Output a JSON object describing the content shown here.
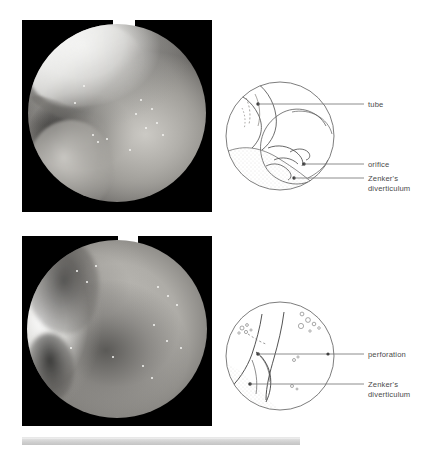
{
  "figure": {
    "background_color": "#ffffff",
    "width": 434,
    "height": 449
  },
  "panels": [
    {
      "id": "panel-top",
      "photo": {
        "name": "endoscopic-photo-zenker-with-tube",
        "alt_text": "Endoscopic photograph showing Zenker's diverticulum with nasogastric tube",
        "background_color": "#000000",
        "frame": {
          "x": 22,
          "y": 20,
          "width": 190,
          "height": 192
        }
      },
      "diagram": {
        "name": "line-diagram-zenker-with-tube",
        "frame": {
          "x": 228,
          "y": 80,
          "width": 108,
          "height": 118
        },
        "labels": [
          {
            "key": "tube",
            "text": "tube",
            "lines": [
              "tube"
            ]
          },
          {
            "key": "orifice",
            "text": "orifice",
            "lines": [
              "orifice"
            ]
          },
          {
            "key": "diverticulum",
            "text": "Zenker's diverticulum",
            "lines": [
              "Zenker's",
              "diverticulum"
            ]
          }
        ]
      }
    },
    {
      "id": "panel-bottom",
      "photo": {
        "name": "endoscopic-photo-perforation",
        "alt_text": "Endoscopic photograph showing perforation above Zenker's diverticulum",
        "background_color": "#000000",
        "frame": {
          "x": 22,
          "y": 236,
          "width": 190,
          "height": 190
        }
      },
      "diagram": {
        "name": "line-diagram-perforation",
        "frame": {
          "x": 228,
          "y": 300,
          "width": 110,
          "height": 116
        },
        "labels": [
          {
            "key": "perforation",
            "text": "perforation",
            "lines": [
              "perforation"
            ]
          },
          {
            "key": "diverticulum",
            "text": "Zenker's diverticulum",
            "lines": [
              "Zenker's",
              "diverticulum"
            ]
          }
        ]
      }
    }
  ],
  "label_text": {
    "tube": "tube",
    "orifice": "orifice",
    "perforation": "perforation",
    "zenkers": "Zenker's",
    "diverticulum": "diverticulum"
  },
  "colors": {
    "page_background": "#ffffff",
    "photo_background": "#000000",
    "diagram_ink": "#4a4a4a",
    "diagram_shading": "#e4e2de",
    "label_text": "#4a4a4a",
    "bottom_bar": "#cfcfcf"
  },
  "bottom_bar": {
    "name": "caption-rule",
    "visible": true
  }
}
